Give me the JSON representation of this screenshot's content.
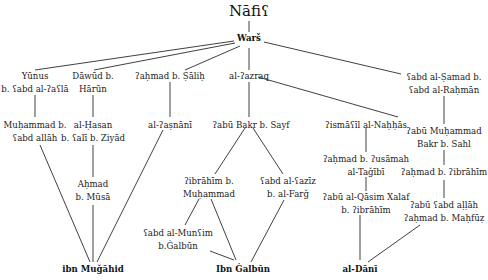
{
  "diagram": {
    "type": "isnad-transmission-tree",
    "root": {
      "id": "nafi",
      "lines": [
        "Nāfiʕ"
      ]
    },
    "nodes": [
      {
        "id": "wars",
        "lines": [
          "Warš"
        ],
        "bold": true
      },
      {
        "id": "yunus",
        "lines": [
          "Yūnus",
          "b. ʕabd al-ʔaʕlā"
        ]
      },
      {
        "id": "dawud",
        "lines": [
          "Dāwūd b.",
          "Hārūn"
        ]
      },
      {
        "id": "ahmad_salih",
        "lines": [
          "ʔaḥmad b. Ṣāliḥ"
        ]
      },
      {
        "id": "azraq",
        "lines": [
          "al-ʔazraq"
        ]
      },
      {
        "id": "abd_samad",
        "lines": [
          "ʕabd al-Ṣamad b.",
          "ʕabd al-Raḥmān"
        ]
      },
      {
        "id": "muhammad_abdallah",
        "lines": [
          "Muḥammad b.",
          "ʕabd allāh"
        ]
      },
      {
        "id": "hasan",
        "lines": [
          "al-Ḥasan",
          "b. ʕalī b. Ziyād"
        ]
      },
      {
        "id": "asnani",
        "lines": [
          "al-ʔaṣnānī"
        ]
      },
      {
        "id": "abu_bakr_sayf",
        "lines": [
          "ʔabū Bakr b. Sayf"
        ]
      },
      {
        "id": "ismail_nahhas",
        "lines": [
          "ʔismāʕīl al-Naḥḥās"
        ]
      },
      {
        "id": "abu_muhammad",
        "lines": [
          "ʔabū Muḥammad",
          "Bakr b. Sahl"
        ]
      },
      {
        "id": "ahmad_musa",
        "lines": [
          "Aḥmad",
          "b. Mūsā"
        ]
      },
      {
        "id": "ibrahim_muhammad",
        "lines": [
          "ʔibrāhīm b.",
          "Muḥammad"
        ]
      },
      {
        "id": "abd_aziz",
        "lines": [
          "ʕabd al-ʕazīz",
          "b. al-Farǧ"
        ]
      },
      {
        "id": "ahmad_usamah",
        "lines": [
          "ʔaḥmad b. ʔusāmah",
          "al-Taǧībī"
        ]
      },
      {
        "id": "ahmad_ibrahim",
        "lines": [
          "ʔaḥmad b. ʔibrāhīm"
        ]
      },
      {
        "id": "abu_qasim",
        "lines": [
          "ʔabū al-Qāsim Xalaf",
          "b. ʔibrāhīm"
        ]
      },
      {
        "id": "abd_munim",
        "lines": [
          "ʕabd al-Munʕim",
          "b.Ġalbūn"
        ]
      },
      {
        "id": "abu_abdallah",
        "lines": [
          "ʔabū ʕabd aḷḷāh",
          "ʔaḥmad b. Maḥfūẓ"
        ]
      },
      {
        "id": "ibn_mujahid",
        "lines": [
          "ibn Muǧāhid"
        ],
        "bold": true
      },
      {
        "id": "ibn_galbun",
        "lines": [
          "Ibn Ġalbūn"
        ],
        "bold": true
      },
      {
        "id": "dani",
        "lines": [
          "al-Dānī"
        ],
        "bold": true
      }
    ],
    "edges": [
      [
        "nafi",
        "wars"
      ],
      [
        "wars",
        "yunus"
      ],
      [
        "wars",
        "dawud"
      ],
      [
        "wars",
        "ahmad_salih"
      ],
      [
        "wars",
        "azraq"
      ],
      [
        "wars",
        "abd_samad"
      ],
      [
        "yunus",
        "muhammad_abdallah"
      ],
      [
        "dawud",
        "hasan"
      ],
      [
        "ahmad_salih",
        "asnani"
      ],
      [
        "azraq",
        "abu_bakr_sayf"
      ],
      [
        "azraq",
        "ismail_nahhas"
      ],
      [
        "abd_samad",
        "abu_muhammad"
      ],
      [
        "hasan",
        "ahmad_musa"
      ],
      [
        "abu_bakr_sayf",
        "ibrahim_muhammad"
      ],
      [
        "abu_bakr_sayf",
        "abd_aziz"
      ],
      [
        "ismail_nahhas",
        "ahmad_usamah"
      ],
      [
        "ahmad_usamah",
        "abu_qasim"
      ],
      [
        "abu_muhammad",
        "ahmad_ibrahim"
      ],
      [
        "ahmad_ibrahim",
        "abu_abdallah"
      ],
      [
        "ibrahim_muhammad",
        "abd_munim"
      ],
      [
        "muhammad_abdallah",
        "ibn_mujahid"
      ],
      [
        "ahmad_musa",
        "ibn_mujahid"
      ],
      [
        "asnani",
        "ibn_mujahid"
      ],
      [
        "ibrahim_muhammad",
        "ibn_galbun"
      ],
      [
        "abd_aziz",
        "ibn_galbun"
      ],
      [
        "abd_munim",
        "ibn_galbun"
      ],
      [
        "abu_qasim",
        "dani"
      ],
      [
        "abu_abdallah",
        "dani"
      ]
    ]
  }
}
